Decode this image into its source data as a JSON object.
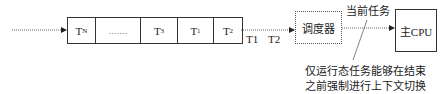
{
  "queue": {
    "cells": [
      {
        "main": "T",
        "sub": "N"
      },
      {
        "main": ".......",
        "sub": ""
      },
      {
        "main": "T",
        "sub": "3"
      },
      {
        "main": "T",
        "sub": "1"
      },
      {
        "main": "T",
        "sub": "2"
      }
    ]
  },
  "flow_labels": {
    "t1": "T1",
    "t2": "T2"
  },
  "scheduler": {
    "label": "调度器"
  },
  "current_task": {
    "label": "当前任务"
  },
  "cpu": {
    "label": "主CPU"
  },
  "annotation": {
    "line1": "仅运行态任务能够在结束",
    "line2": "之前强制进行上下文切换"
  },
  "colors": {
    "stroke": "#333333",
    "dotted": "#555555",
    "background": "#ffffff"
  }
}
